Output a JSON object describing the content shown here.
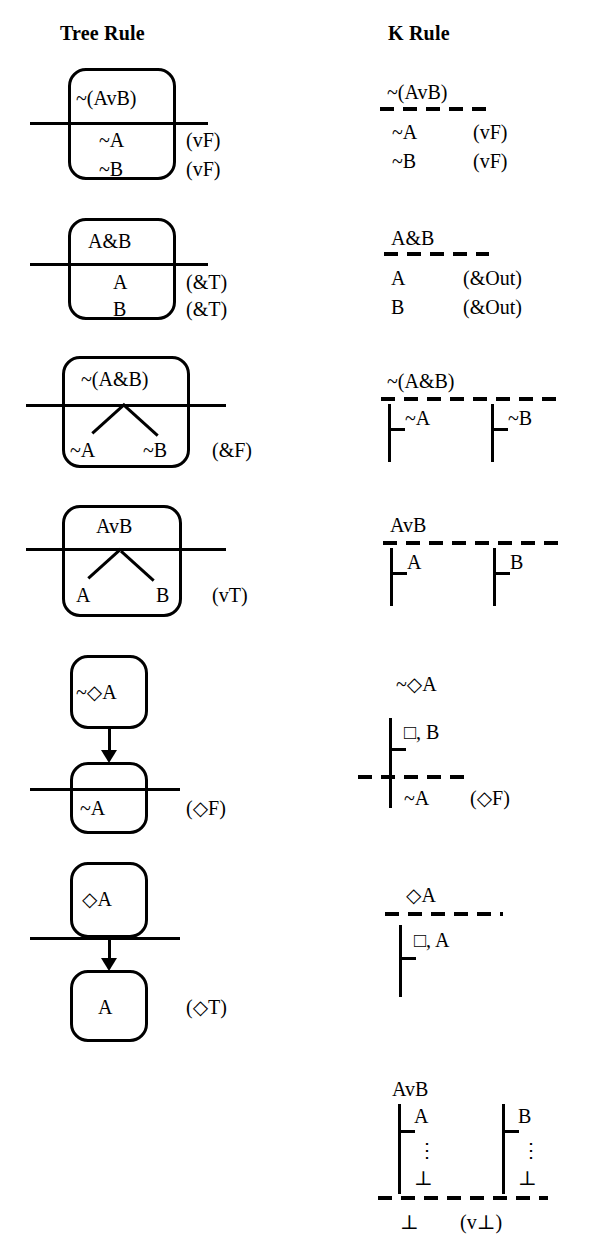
{
  "headers": {
    "tree": "Tree Rule",
    "k": "K Rule"
  },
  "rules": [
    {
      "id": "neg-disjunction",
      "tree": {
        "premise": "~(AvB)",
        "conclusions": [
          "~A",
          "~B"
        ],
        "labels": [
          "(vF)",
          "(vF)"
        ]
      },
      "k": {
        "premise": "~(AvB)",
        "conclusions": [
          "~A",
          "~B"
        ],
        "labels": [
          "(vF)",
          "(vF)"
        ]
      }
    },
    {
      "id": "conjunction",
      "tree": {
        "premise": "A&B",
        "conclusions": [
          "A",
          "B"
        ],
        "labels": [
          "(&T)",
          "(&T)"
        ]
      },
      "k": {
        "premise": "A&B",
        "conclusions": [
          "A",
          "B"
        ],
        "labels": [
          "(&Out)",
          "(&Out)"
        ]
      }
    },
    {
      "id": "neg-conjunction",
      "tree": {
        "premise": "~(A&B)",
        "branches": [
          "~A",
          "~B"
        ],
        "label": "(&F)"
      },
      "k": {
        "premise": "~(A&B)",
        "branches": [
          "~A",
          "~B"
        ]
      }
    },
    {
      "id": "disjunction",
      "tree": {
        "premise": "AvB",
        "branches": [
          "A",
          "B"
        ],
        "label": "(vT)"
      },
      "k": {
        "premise": "AvB",
        "branches": [
          "A",
          "B"
        ]
      }
    },
    {
      "id": "neg-diamond",
      "tree": {
        "premise": "~◇A",
        "conclusion": "~A",
        "label": "(◇F)"
      },
      "k": {
        "premise": "~◇A",
        "world": "□, B",
        "conclusion": "~A",
        "label": "(◇F)"
      }
    },
    {
      "id": "diamond",
      "tree": {
        "premise": "◇A",
        "conclusion": "A",
        "label": "(◇T)"
      },
      "k": {
        "premise": "◇A",
        "world": "□, A"
      }
    },
    {
      "id": "disjunction-bottom",
      "k": {
        "premise": "AvB",
        "branches": [
          {
            "assumption": "A",
            "dots": "⋮",
            "end": "⊥"
          },
          {
            "assumption": "B",
            "dots": "⋮",
            "end": "⊥"
          }
        ],
        "conclusion": "⊥",
        "label": "(v⊥)"
      }
    }
  ]
}
